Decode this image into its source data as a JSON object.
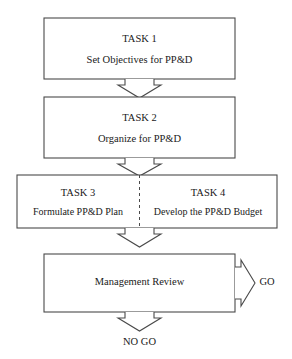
{
  "diagram": {
    "type": "flowchart",
    "orientation": "vertical",
    "background_color": "#ffffff",
    "stroke_color": "#4a4a4a",
    "text_color": "#1a1a1a",
    "nodes": [
      {
        "id": "task1",
        "title": "TASK 1",
        "subtitle": "Set Objectives for PP&D"
      },
      {
        "id": "task2",
        "title": "TASK 2",
        "subtitle": "Organize for PP&D"
      },
      {
        "id": "task3",
        "title": "TASK 3",
        "subtitle": "Formulate PP&D Plan"
      },
      {
        "id": "task4",
        "title": "TASK 4",
        "subtitle": "Develop the PP&D Budget"
      },
      {
        "id": "review",
        "title": "Management Review",
        "subtitle": ""
      }
    ],
    "outcomes": {
      "go_label": "GO",
      "no_go_label": "NO GO"
    },
    "connectors": [
      {
        "id": "arrow-task1-task2",
        "direction": "down"
      },
      {
        "id": "arrow-task2-task34",
        "direction": "down"
      },
      {
        "id": "arrow-task34-review",
        "direction": "down"
      },
      {
        "id": "arrow-review-go",
        "direction": "right"
      },
      {
        "id": "arrow-review-nogo",
        "direction": "down"
      }
    ]
  }
}
